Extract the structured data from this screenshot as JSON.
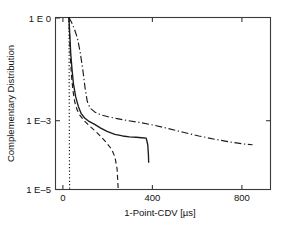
{
  "chart_data": {
    "type": "line",
    "title": "",
    "xlabel": "1-Point-CDV [µs]",
    "ylabel": "Complementary Distribution",
    "xlim": [
      -60,
      900
    ],
    "ylim_log10": [
      -5,
      0
    ],
    "yscale": "log",
    "xscale": "linear",
    "grid": false,
    "legend": "none",
    "xticks": [
      0,
      400,
      800
    ],
    "xticklabels": [
      "0",
      "400",
      "800"
    ],
    "yticks": [
      1,
      0.001,
      1e-05
    ],
    "yticklabels": [
      "1 E 0",
      "1 E–3",
      "1 E–5"
    ],
    "series": [
      {
        "name": "dotted",
        "style": "dotted",
        "points": [
          [
            0,
            1.0
          ],
          [
            0.5,
            0.2
          ],
          [
            1,
            0.02
          ],
          [
            1.5,
            0.002
          ],
          [
            2,
            0.0002
          ],
          [
            2.5,
            3e-05
          ],
          [
            3,
            1e-05
          ]
        ]
      },
      {
        "name": "solid",
        "style": "solid",
        "points": [
          [
            0,
            1.0
          ],
          [
            4,
            0.3
          ],
          [
            8,
            0.09
          ],
          [
            14,
            0.03
          ],
          [
            20,
            0.012
          ],
          [
            30,
            0.005
          ],
          [
            42,
            0.0026
          ],
          [
            55,
            0.0016
          ],
          [
            70,
            0.0012
          ],
          [
            90,
            0.00095
          ],
          [
            115,
            0.00078
          ],
          [
            140,
            0.00062
          ],
          [
            170,
            0.00049
          ],
          [
            205,
            0.0004
          ],
          [
            240,
            0.00036
          ],
          [
            270,
            0.00034
          ],
          [
            300,
            0.00033
          ],
          [
            325,
            0.00032
          ],
          [
            345,
            0.00031
          ],
          [
            352,
            0.0002
          ],
          [
            355,
            0.0001
          ],
          [
            356,
            6e-05
          ]
        ]
      },
      {
        "name": "dashed",
        "style": "dashed",
        "points": [
          [
            0,
            1.0
          ],
          [
            3,
            0.25
          ],
          [
            7,
            0.06
          ],
          [
            12,
            0.018
          ],
          [
            18,
            0.0075
          ],
          [
            26,
            0.0035
          ],
          [
            36,
            0.0021
          ],
          [
            50,
            0.0014
          ],
          [
            68,
            0.001
          ],
          [
            90,
            0.00072
          ],
          [
            115,
            0.00052
          ],
          [
            140,
            0.00036
          ],
          [
            165,
            0.00024
          ],
          [
            190,
            0.00015
          ],
          [
            205,
            9e-05
          ],
          [
            215,
            4e-05
          ],
          [
            220,
            1e-05
          ]
        ]
      },
      {
        "name": "dash-dot",
        "style": "dashdot",
        "points": [
          [
            0,
            1.0
          ],
          [
            12,
            0.72
          ],
          [
            25,
            0.45
          ],
          [
            38,
            0.25
          ],
          [
            50,
            0.1
          ],
          [
            62,
            0.03
          ],
          [
            72,
            0.009
          ],
          [
            82,
            0.0036
          ],
          [
            95,
            0.0023
          ],
          [
            115,
            0.0018
          ],
          [
            140,
            0.0015
          ],
          [
            175,
            0.0013
          ],
          [
            215,
            0.00115
          ],
          [
            265,
            0.001
          ],
          [
            320,
            0.00088
          ],
          [
            380,
            0.00074
          ],
          [
            440,
            0.0006
          ],
          [
            510,
            0.00046
          ],
          [
            580,
            0.00036
          ],
          [
            650,
            0.00029
          ],
          [
            720,
            0.00024
          ],
          [
            780,
            0.00021
          ],
          [
            820,
            0.0002
          ]
        ]
      }
    ]
  },
  "axes": {
    "xlabel": "1-Point-CDV [µs]",
    "ylabel": "Complementary Distribution",
    "xtick_0": "0",
    "xtick_1": "400",
    "xtick_2": "800",
    "ytick_0": "1 E 0",
    "ytick_1": "1 E–3",
    "ytick_2": "1 E–5"
  },
  "colors": {
    "background": "#ffffff",
    "frame": "#3a3a3a",
    "curve": "#1b1b1b",
    "text": "#111111"
  }
}
